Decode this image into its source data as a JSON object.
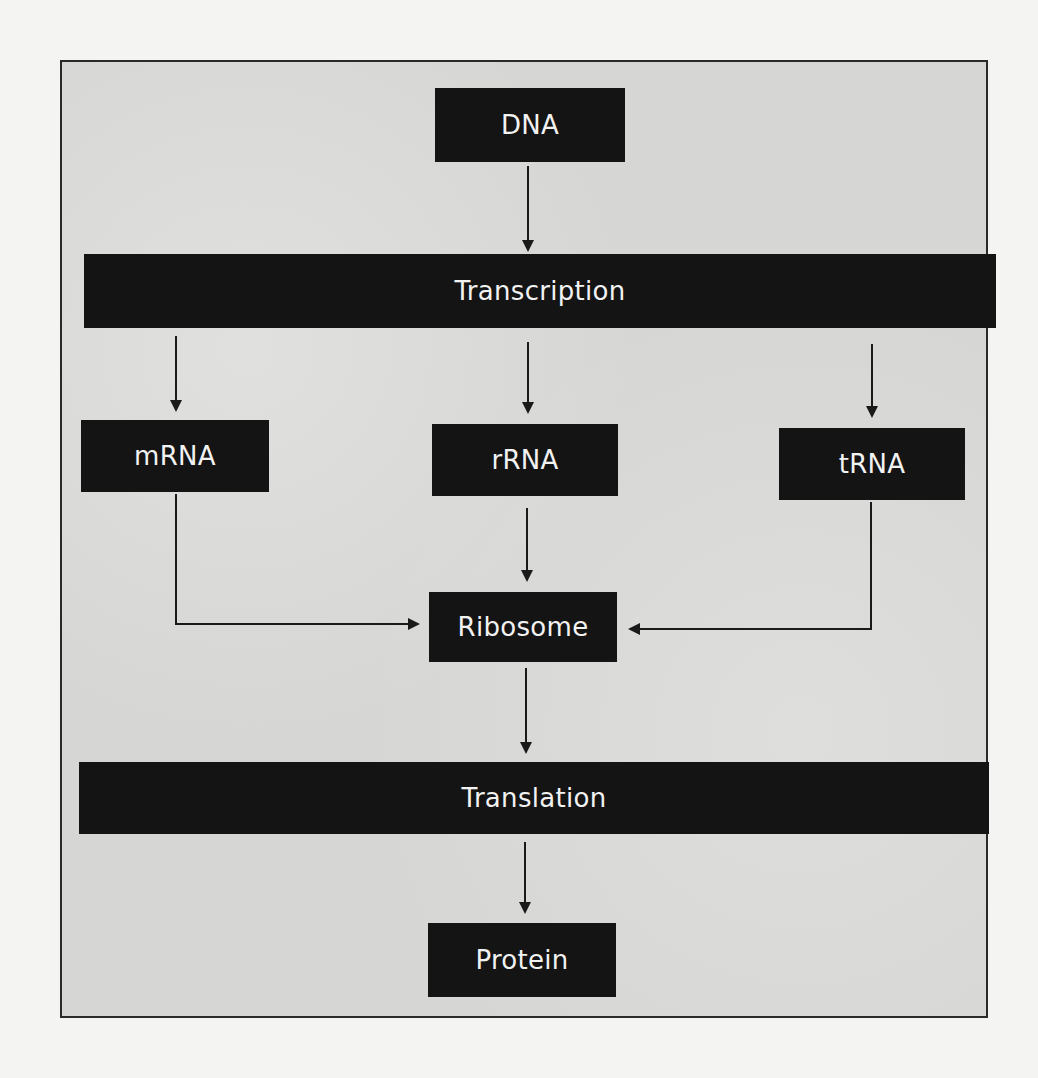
{
  "diagram": {
    "nodes": {
      "dna": "DNA",
      "transcription": "Transcription",
      "mrna": "mRNA",
      "rrna": "rRNA",
      "trna": "tRNA",
      "ribosome": "Ribosome",
      "translation": "Translation",
      "protein": "Protein"
    },
    "edges": [
      {
        "from": "DNA",
        "to": "Transcription"
      },
      {
        "from": "Transcription",
        "to": "mRNA"
      },
      {
        "from": "Transcription",
        "to": "rRNA"
      },
      {
        "from": "Transcription",
        "to": "tRNA"
      },
      {
        "from": "mRNA",
        "to": "Ribosome"
      },
      {
        "from": "rRNA",
        "to": "Ribosome"
      },
      {
        "from": "tRNA",
        "to": "Ribosome"
      },
      {
        "from": "Ribosome",
        "to": "Translation"
      },
      {
        "from": "Translation",
        "to": "Protein"
      }
    ],
    "colors": {
      "node_fill": "#141414",
      "node_text": "#f2f2f2",
      "background": "#d6d6d4",
      "border": "#2a2a2a"
    }
  }
}
